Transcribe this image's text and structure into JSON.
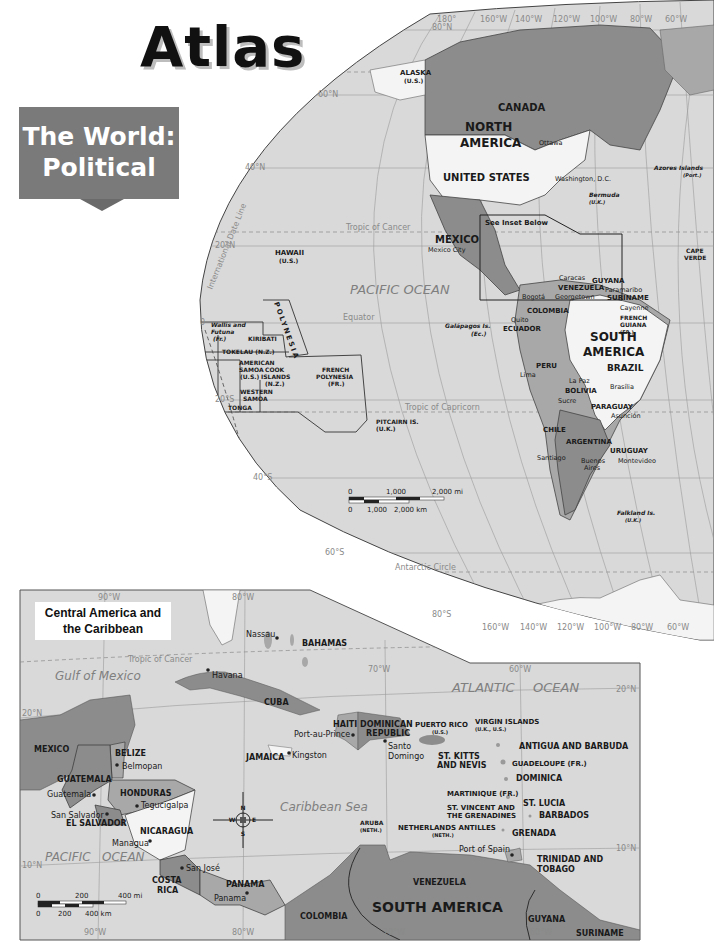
{
  "header": {
    "title": "Atlas",
    "banner_line1": "The World:",
    "banner_line2": "Political"
  },
  "world_map": {
    "grid_labels": {
      "lat": [
        "80°N",
        "60°N",
        "40°N",
        "20°N",
        "0",
        "20°S",
        "40°S",
        "60°S",
        "80°S"
      ],
      "lon_top": [
        "180°",
        "160°W",
        "140°W",
        "120°W",
        "100°W",
        "80°W",
        "60°W"
      ],
      "lon_bottom": [
        "160°W",
        "140°W",
        "120°W",
        "100°W",
        "80°W",
        "60°W"
      ]
    },
    "lines": {
      "tropic_cancer": "Tropic of Cancer",
      "equator": "Equator",
      "tropic_capricorn": "Tropic of Capricorn",
      "antarctic_circle": "Antarctic Circle",
      "date_line": "International Date Line"
    },
    "oceans": {
      "pacific": "PACIFIC OCEAN"
    },
    "continents": {
      "north_america_1": "NORTH",
      "north_america_2": "AMERICA",
      "south_america_1": "SOUTH",
      "south_america_2": "AMERICA"
    },
    "countries": {
      "alaska": "ALASKA",
      "alaska_sub": "(U.S.)",
      "canada": "CANADA",
      "usa": "UNITED STATES",
      "mexico": "MEXICO",
      "hawaii": "HAWAII",
      "hawaii_sub": "(U.S.)",
      "kiribati": "KIRIBATI",
      "polynesia": "POLYNESIA",
      "wallis": "Wallis and",
      "wallis2": "Futuna",
      "wallis_sub": "(Fr.)",
      "tokelau": "TOKELAU (N.Z.)",
      "american_samoa1": "AMERICAN",
      "american_samoa2": "SAMOA",
      "american_samoa_sub": "(U.S.)",
      "cook1": "COOK",
      "cook2": "ISLANDS",
      "cook_sub": "(N.Z.)",
      "western_samoa1": "WESTERN",
      "western_samoa2": "SAMOA",
      "tonga": "TONGA",
      "french_polynesia1": "FRENCH",
      "french_polynesia2": "POLYNESIA",
      "french_polynesia_sub": "(FR.)",
      "pitcairn": "PITCAIRN IS.",
      "pitcairn_sub": "(U.K.)",
      "galapagos": "Galápagos Is.",
      "galapagos_sub": "(Ec.)",
      "bermuda": "Bermuda",
      "bermuda_sub": "(U.K.)",
      "azores": "Azores Islands",
      "azores_sub": "(Port.)",
      "cape_verde1": "CAPE",
      "cape_verde2": "VERDE",
      "venezuela": "VENEZUELA",
      "colombia": "COLOMBIA",
      "ecuador": "ECUADOR",
      "guyana": "GUYANA",
      "suriname": "SURINAME",
      "french_guiana1": "FRENCH",
      "french_guiana2": "GUIANA",
      "french_guiana_sub": "(FR.)",
      "peru": "PERU",
      "brazil": "BRAZIL",
      "bolivia": "BOLIVIA",
      "paraguay": "PARAGUAY",
      "chile": "CHILE",
      "argentina": "ARGENTINA",
      "uruguay": "URUGUAY",
      "falkland": "Falkland Is.",
      "falkland_sub": "(U.K.)"
    },
    "cities": {
      "ottawa": "Ottawa",
      "washington": "Washington, D.C.",
      "mexico_city": "Mexico City",
      "caracas": "Caracas",
      "bogota": "Bogotá",
      "georgetown": "Georgetown",
      "paramaribo": "Paramaribo",
      "cayenne": "Cayenne",
      "quito": "Quito",
      "lima": "Lima",
      "la_paz": "La Paz",
      "sucre": "Sucre",
      "brasilia": "Brasília",
      "asuncion": "Asunción",
      "santiago": "Santiago",
      "buenos_aires1": "Buenos",
      "buenos_aires2": "Aires",
      "montevideo": "Montevideo"
    },
    "inset_note": "See Inset Below",
    "scale": {
      "mi_0": "0",
      "mi_1": "1,000",
      "mi_2": "2,000 mi",
      "km_0": "0",
      "km_1": "1,000",
      "km_2": "2,000 km"
    }
  },
  "inset_map": {
    "title_line1": "Central America and",
    "title_line2": "the Caribbean",
    "grid_labels": {
      "lon_90": "90°W",
      "lon_80": "80°W",
      "lon_70": "70°W",
      "lon_60": "60°W",
      "lat_20": "20°N",
      "lat_10": "10°N"
    },
    "lines": {
      "tropic_cancer": "Tropic of Cancer"
    },
    "water": {
      "gulf": "Gulf of Mexico",
      "atlantic1": "ATLANTIC",
      "atlantic2": "OCEAN",
      "caribbean": "Caribbean Sea",
      "pacific1": "PACIFIC",
      "pacific2": "OCEAN"
    },
    "countries": {
      "bahamas": "BAHAMAS",
      "cuba": "CUBA",
      "haiti": "HAITI",
      "dominican1": "DOMINICAN",
      "dominican2": "REPUBLIC",
      "puerto_rico": "PUERTO RICO",
      "puerto_rico_sub": "(U.S.)",
      "virgin": "VIRGIN ISLANDS",
      "virgin_sub": "(U.K., U.S.)",
      "antigua": "ANTIGUA AND BARBUDA",
      "st_kitts1": "ST. KITTS",
      "st_kitts2": "AND NEVIS",
      "guadeloupe": "GUADELOUPE (FR.)",
      "dominica": "DOMINICA",
      "martinique": "MARTINIQUE (FR.)",
      "st_lucia": "ST. LUCIA",
      "st_vincent1": "ST. VINCENT AND",
      "st_vincent2": "THE GRENADINES",
      "barbados": "BARBADOS",
      "grenada": "GRENADA",
      "trinidad1": "TRINIDAD AND",
      "trinidad2": "TOBAGO",
      "aruba": "ARUBA",
      "aruba_sub": "(NETH.)",
      "neth_antilles": "NETHERLANDS ANTILLES",
      "neth_antilles_sub": "(NETH.)",
      "jamaica": "JAMAICA",
      "mexico": "MEXICO",
      "belize": "BELIZE",
      "guatemala": "GUATEMALA",
      "honduras": "HONDURAS",
      "el_salvador": "EL SALVADOR",
      "nicaragua": "NICARAGUA",
      "costa_rica1": "COSTA",
      "costa_rica2": "RICA",
      "panama": "PANAMA",
      "venezuela": "VENEZUELA",
      "colombia": "COLOMBIA",
      "guyana": "GUYANA",
      "suriname": "SURINAME",
      "south_america": "SOUTH AMERICA"
    },
    "cities": {
      "nassau": "Nassau",
      "havana": "Havana",
      "port_au_prince": "Port-au-Prince",
      "santo_domingo1": "Santo",
      "santo_domingo2": "Domingo",
      "kingston": "Kingston",
      "belmopan": "Belmopan",
      "guatemala": "Guatemala",
      "tegucigalpa": "Tegucigalpa",
      "san_salvador": "San Salvador",
      "managua": "Managua",
      "san_jose": "San José",
      "panama": "Panama",
      "port_of_spain": "Port of Spain"
    },
    "compass": {
      "n": "N",
      "s": "S",
      "e": "E",
      "w": "W"
    },
    "scale": {
      "mi_0": "0",
      "mi_1": "200",
      "mi_2": "400 mi",
      "km_0": "0",
      "km_1": "200",
      "km_2": "400 km"
    }
  },
  "colors": {
    "ocean": "#d9d9d9",
    "land_dark": "#8c8c8c",
    "land_mid": "#a8a8a8",
    "land_light": "#f4f4f4",
    "grid": "#9a9a9a",
    "banner": "#7a7a7a"
  }
}
